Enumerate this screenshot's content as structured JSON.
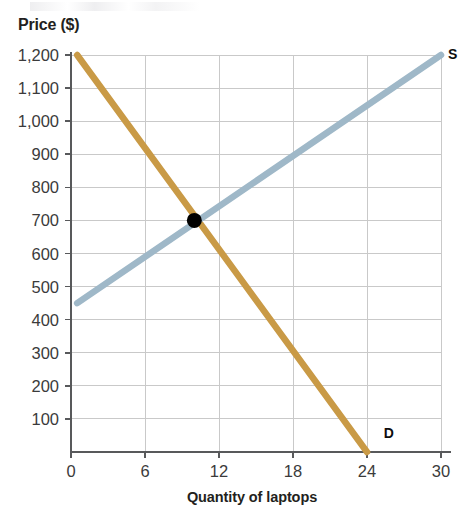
{
  "chart_data": {
    "type": "line",
    "title": "",
    "xlabel": "Quantity of laptops",
    "ylabel": "Price ($)",
    "xlim": [
      0,
      30
    ],
    "ylim": [
      0,
      1200
    ],
    "grid": true,
    "legend": "inline-curve-labels",
    "x_ticks": [
      0,
      6,
      12,
      18,
      24,
      30
    ],
    "x_tick_labels": [
      "0",
      "6",
      "12",
      "18",
      "24",
      "30"
    ],
    "y_ticks": [
      100,
      200,
      300,
      400,
      500,
      600,
      700,
      800,
      900,
      1000,
      1100,
      1200
    ],
    "y_tick_labels": [
      "100",
      "200",
      "300",
      "400",
      "500",
      "600",
      "700",
      "800",
      "900",
      "1,000",
      "1,100",
      "1,200"
    ],
    "series": [
      {
        "name": "D",
        "label": "D",
        "role": "demand",
        "color": "#c99a46",
        "points": [
          {
            "x": 0.5,
            "y": 1200
          },
          {
            "x": 24,
            "y": 0
          }
        ]
      },
      {
        "name": "S",
        "label": "S",
        "role": "supply",
        "color": "#9fb8c8",
        "points": [
          {
            "x": 0.5,
            "y": 450
          },
          {
            "x": 30,
            "y": 1200
          }
        ]
      }
    ],
    "annotations": [
      {
        "name": "equilibrium-point",
        "kind": "point",
        "x": 10,
        "y": 700,
        "color": "#000000"
      },
      {
        "name": "supply-curve-label",
        "kind": "text",
        "text": "S",
        "x": 30,
        "y": 1200
      },
      {
        "name": "demand-curve-label",
        "kind": "text",
        "text": "D",
        "x": 24.8,
        "y": 55
      }
    ],
    "axis_color": "#58595b",
    "grid_color": "#c9c9c9",
    "background": "#ffffff"
  }
}
